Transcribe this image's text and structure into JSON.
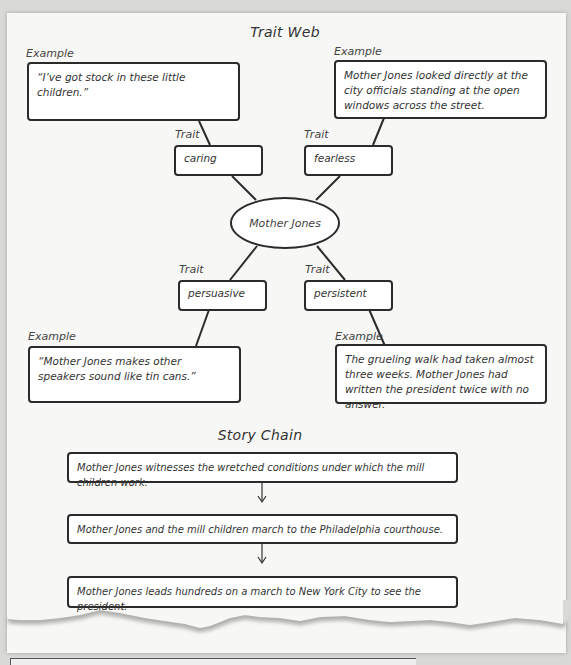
{
  "trait_web": {
    "title": "Trait Web",
    "center": "Mother Jones",
    "branches": [
      {
        "trait_label": "Trait",
        "trait": "caring",
        "example_label": "Example",
        "example": "“I’ve got stock in these little children.”"
      },
      {
        "trait_label": "Trait",
        "trait": "fearless",
        "example_label": "Example",
        "example": "Mother Jones looked directly at the city officials standing at the open windows across the street."
      },
      {
        "trait_label": "Trait",
        "trait": "persuasive",
        "example_label": "Example",
        "example": "“Mother Jones makes other speakers sound like tin cans.”"
      },
      {
        "trait_label": "Trait",
        "trait": "persistent",
        "example_label": "Example",
        "example": "The grueling walk had taken almost three weeks. Mother Jones had written the president twice with no answer."
      }
    ]
  },
  "story_chain": {
    "title": "Story Chain",
    "events": [
      "Mother Jones witnesses the wretched conditions under which the mill children work.",
      "Mother Jones and the mill children march to the Philadelphia courthouse.",
      "Mother Jones leads hundreds on a march to New York City to see the president."
    ]
  },
  "colors": {
    "page": "#f7f7f5",
    "background": "#d9d9d7",
    "border": "#2b2b2b",
    "text": "#333333"
  }
}
